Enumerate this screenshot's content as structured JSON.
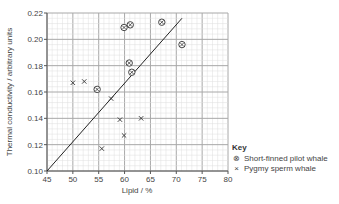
{
  "chart_data": {
    "type": "scatter",
    "title": "",
    "xlabel": "Lipid / %",
    "ylabel": "Thermal conductivity / arbitrary units",
    "xlim": [
      45,
      80
    ],
    "ylim": [
      0.1,
      0.22
    ],
    "x_ticks": [
      "45",
      "50",
      "55",
      "60",
      "65",
      "70",
      "75",
      "80"
    ],
    "y_ticks": [
      "0.10",
      "0.12",
      "0.14",
      "0.16",
      "0.18",
      "0.20",
      "0.22"
    ],
    "grid": true,
    "legend_position": "lower-right outside",
    "series": [
      {
        "name": "Short-finned pilot whale",
        "marker": "circled-x",
        "points": [
          {
            "x": 54.7,
            "y": 0.162
          },
          {
            "x": 59.9,
            "y": 0.209
          },
          {
            "x": 61.1,
            "y": 0.211
          },
          {
            "x": 67.2,
            "y": 0.213
          },
          {
            "x": 71.1,
            "y": 0.196
          },
          {
            "x": 60.9,
            "y": 0.182
          },
          {
            "x": 61.4,
            "y": 0.175
          }
        ]
      },
      {
        "name": "Pygmy sperm whale",
        "marker": "x",
        "points": [
          {
            "x": 50.0,
            "y": 0.167
          },
          {
            "x": 52.2,
            "y": 0.168
          },
          {
            "x": 57.4,
            "y": 0.155
          },
          {
            "x": 59.1,
            "y": 0.139
          },
          {
            "x": 63.2,
            "y": 0.14
          },
          {
            "x": 59.9,
            "y": 0.127
          },
          {
            "x": 55.6,
            "y": 0.117
          }
        ]
      }
    ],
    "trend_line": {
      "x1": 45,
      "y1": 0.1,
      "x2": 71.1,
      "y2": 0.216
    }
  },
  "key": {
    "title": "Key",
    "items": [
      {
        "symbol": "⊗",
        "label": "Short-finned pilot whale"
      },
      {
        "symbol": "×",
        "label": "Pygmy sperm whale"
      }
    ]
  }
}
